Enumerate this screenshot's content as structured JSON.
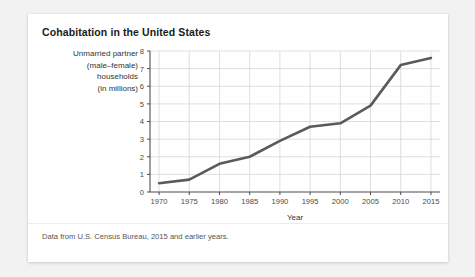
{
  "card": {
    "title": "Cohabitation in the United States",
    "source_note": "Data from U.S. Census Bureau, 2015 and earlier years.",
    "background": "#ffffff",
    "page_background": "#f2f2f2"
  },
  "chart_data": {
    "type": "line",
    "title": "Cohabitation in the United States",
    "xlabel": "Year",
    "ylabel": "Unmarried partner (male–female) households (in millions)",
    "ylabel_lines": [
      "Unmarried partner",
      "(male–female)",
      "households",
      "(in millions)"
    ],
    "x": [
      1970,
      1975,
      1980,
      1985,
      1990,
      1995,
      2000,
      2005,
      2010,
      2015
    ],
    "values": [
      0.5,
      0.7,
      1.6,
      2.0,
      2.9,
      3.7,
      3.9,
      4.9,
      7.2,
      7.6
    ],
    "xlim": [
      1968.5,
      2016.5
    ],
    "ylim": [
      0,
      8
    ],
    "xticks": [
      1970,
      1975,
      1980,
      1985,
      1990,
      1995,
      2000,
      2005,
      2010,
      2015
    ],
    "xtick_labels": [
      "1970",
      "1975",
      "1980",
      "1985",
      "1990",
      "1995",
      "2000",
      "2005",
      "2010",
      "2015"
    ],
    "yticks": [
      0,
      1,
      2,
      3,
      4,
      5,
      6,
      7,
      8
    ],
    "ytick_labels": [
      "0",
      "1",
      "2",
      "3",
      "4",
      "5",
      "6",
      "7",
      "8"
    ],
    "grid": true,
    "grid_color": "#d6d6d6",
    "line_color": "#5a5a5a",
    "line_width": 2.6,
    "axis_color": "#4d4d4d",
    "legend": "none"
  }
}
